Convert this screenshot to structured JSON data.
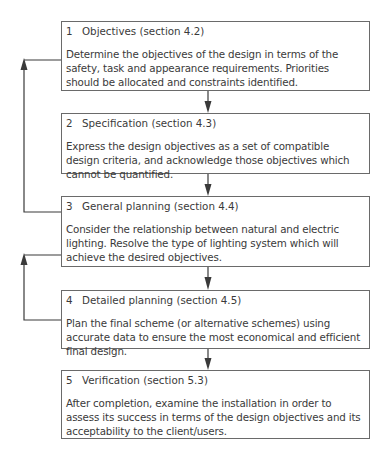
{
  "diagram": {
    "type": "flowchart",
    "steps": [
      {
        "number": "1",
        "title": "Objectives (section 4.2)",
        "text": "Determine the objectives of the design in terms of the safety, task and appearance requirements.  Priorities should be allocated and constraints identified."
      },
      {
        "number": "2",
        "title": "Specification (section 4.3)",
        "text": "Express the design objectives as a set of compatible  design criteria, and acknowledge those objectives which cannot be quantified."
      },
      {
        "number": "3",
        "title": "General planning (section 4.4)",
        "text": "Consider the relationship between natural and electric lighting. Resolve the type of lighting system which will achieve the desired objectives."
      },
      {
        "number": "4",
        "title": "Detailed planning (section 4.5)",
        "text": "Plan the final scheme (or alternative schemes) using accurate data to ensure the most economical and efficient final design."
      },
      {
        "number": "5",
        "title": "Verification (section 5.3)",
        "text": "After completion, examine the installation in order to assess its success in terms of the design objectives and its acceptability to the client/users."
      }
    ],
    "connections": [
      {
        "from": "1",
        "to": "2",
        "kind": "forward"
      },
      {
        "from": "2",
        "to": "3",
        "kind": "forward"
      },
      {
        "from": "3",
        "to": "4",
        "kind": "forward"
      },
      {
        "from": "4",
        "to": "5",
        "kind": "forward"
      },
      {
        "from": "3",
        "to": "1",
        "kind": "feedback"
      },
      {
        "from": "4",
        "to": "3",
        "kind": "feedback"
      }
    ],
    "colors": {
      "line": "#3a3a3a",
      "border": "#6a6a6a",
      "text": "#3a3a3a"
    }
  }
}
